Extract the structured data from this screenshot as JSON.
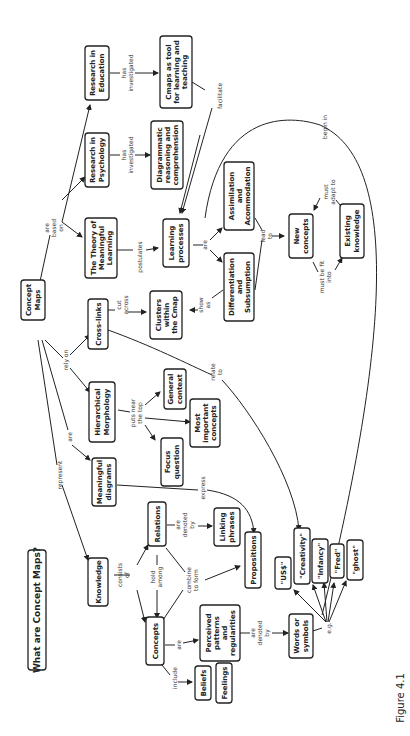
{
  "title": "What are Concept Maps?",
  "figure_label": "Figure 4.1",
  "nodes": {
    "concept_maps": [
      "Concept",
      "Maps"
    ],
    "research_education": [
      "Research in",
      "Education"
    ],
    "research_psychology": [
      "Research in",
      "Psychology"
    ],
    "theory": [
      "The Theory of",
      "Meaningful",
      "Learning"
    ],
    "cmaps_tool": [
      "Cmaps as tool",
      "for learning and",
      "teaching"
    ],
    "diagrammatic": [
      "Diagrammatic",
      "reasoning and",
      "comprehension"
    ],
    "learning_processes": [
      "Learning",
      "processes"
    ],
    "assimilation": [
      "Assimilation",
      "and",
      "Acommodation"
    ],
    "differentiation": [
      "Differentiation",
      "and",
      "Subsumption"
    ],
    "new_concepts": [
      "New",
      "concepts"
    ],
    "existing_knowledge": [
      "Existing",
      "knowledge"
    ],
    "cross_links": [
      "Cross-links"
    ],
    "clusters": [
      "Clusters",
      "within",
      "the Cmap"
    ],
    "hierarchical": [
      "Hierarchical",
      "Morphology"
    ],
    "general_context": [
      "General",
      "context"
    ],
    "most_important": [
      "Most",
      "important",
      "concepts"
    ],
    "focus_question": [
      "Focus",
      "question"
    ],
    "meaningful_diagrams": [
      "Meaningful",
      "diagrams"
    ],
    "knowledge": [
      "Knowledge"
    ],
    "relations": [
      "Relations"
    ],
    "linking_phrases": [
      "Linking",
      "phrases"
    ],
    "propositions": [
      "Propositions"
    ],
    "concepts": [
      "Concepts"
    ],
    "perceived": [
      "Perceived",
      "patterns",
      "and",
      "regularities"
    ],
    "words_symbols": [
      "Words or",
      "symbols"
    ],
    "beliefs": [
      "Beliefs"
    ],
    "feelings": [
      "Feelings"
    ],
    "ex_us": [
      "\"US$\""
    ],
    "ex_creativity": [
      "\"Creativity\""
    ],
    "ex_infancy": [
      "\"Infancy\""
    ],
    "ex_fred": [
      "\"Fred\""
    ],
    "ex_ghost": [
      "\"ghost\""
    ]
  },
  "links": {
    "are_based_on": [
      "are",
      "based",
      "on"
    ],
    "has_investigated_1": [
      "has",
      "investigated"
    ],
    "has_investigated_2": [
      "has",
      "investigated"
    ],
    "postulates": [
      "postulates"
    ],
    "facilitate": [
      "facilitate"
    ],
    "begin_in": [
      "begin in"
    ],
    "are_lp": [
      "are"
    ],
    "lead_to": [
      "lead",
      "to"
    ],
    "must_adapt_to": [
      "must",
      "adapt to"
    ],
    "must_be_fit_into": [
      "must be fit",
      "into"
    ],
    "show_as": [
      "show",
      "as"
    ],
    "cut_across": [
      "cut",
      "across"
    ],
    "rely_on": [
      "rely on"
    ],
    "puts_near_top": [
      "puts near",
      "the top"
    ],
    "relate_to": [
      "relate",
      "to"
    ],
    "are_md": [
      "are"
    ],
    "represent": [
      "represent"
    ],
    "express": [
      "express"
    ],
    "consists_of": [
      "consists",
      "of"
    ],
    "hold_among": [
      "hold",
      "among"
    ],
    "combine_to_form": [
      "combine",
      "to form"
    ],
    "are_denoted_by_1": [
      "are",
      "denoted",
      "by"
    ],
    "are_denoted_by_2": [
      "are",
      "denoted",
      "by"
    ],
    "are_c": [
      "are"
    ],
    "include": [
      "include"
    ],
    "eg": [
      "e.g."
    ]
  }
}
